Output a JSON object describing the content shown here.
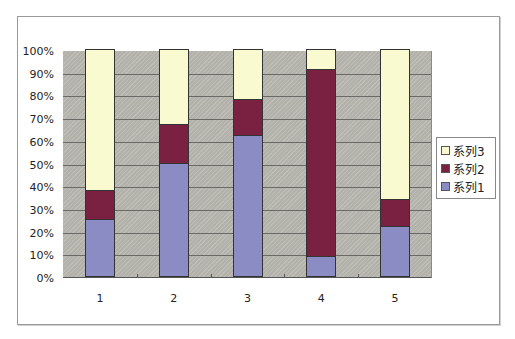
{
  "chart_data": {
    "type": "bar",
    "stacked": "percent",
    "title": "",
    "xlabel": "",
    "ylabel": "",
    "categories": [
      "1",
      "2",
      "3",
      "4",
      "5"
    ],
    "series": [
      {
        "name": "系列1",
        "color": "#8c8cc4",
        "values": [
          25,
          50,
          62,
          9,
          22
        ]
      },
      {
        "name": "系列2",
        "color": "#7a2040",
        "values": [
          13,
          17,
          16,
          82,
          12
        ]
      },
      {
        "name": "系列3",
        "color": "#fafad0",
        "values": [
          62,
          33,
          22,
          9,
          66
        ]
      }
    ],
    "ylim": [
      0,
      100
    ],
    "yticks": [
      "0%",
      "10%",
      "20%",
      "30%",
      "40%",
      "50%",
      "60%",
      "70%",
      "80%",
      "90%",
      "100%"
    ],
    "grid": true,
    "legend_position": "right",
    "legend_order": [
      "系列3",
      "系列2",
      "系列1"
    ],
    "plot_background": "#b9b8b1"
  }
}
